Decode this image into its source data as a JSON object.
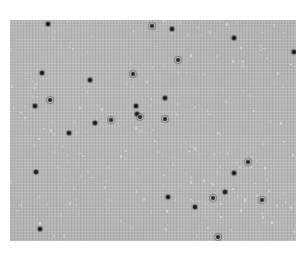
{
  "image": {
    "description": "Grayscale light micrograph with scattered dark particles on a speckled gray field",
    "field": {
      "x": 10,
      "y": 20,
      "width": 286,
      "height": 221,
      "background_color": "#b3b3b3",
      "page_background": "#ffffff"
    },
    "particle_color": "#1a1a1a",
    "particles": [
      {
        "x": 48,
        "y": 24,
        "ring": false
      },
      {
        "x": 152,
        "y": 26,
        "ring": true
      },
      {
        "x": 172,
        "y": 29,
        "ring": false
      },
      {
        "x": 234,
        "y": 38,
        "ring": false
      },
      {
        "x": 294,
        "y": 52,
        "ring": false
      },
      {
        "x": 178,
        "y": 60,
        "ring": true
      },
      {
        "x": 42,
        "y": 73,
        "ring": false
      },
      {
        "x": 133,
        "y": 74,
        "ring": true
      },
      {
        "x": 90,
        "y": 80,
        "ring": false
      },
      {
        "x": 165,
        "y": 98,
        "ring": false
      },
      {
        "x": 50,
        "y": 100,
        "ring": true
      },
      {
        "x": 35,
        "y": 106,
        "ring": false
      },
      {
        "x": 136,
        "y": 106,
        "ring": false
      },
      {
        "x": 137,
        "y": 114,
        "ring": false
      },
      {
        "x": 140,
        "y": 117,
        "ring": true
      },
      {
        "x": 111,
        "y": 120,
        "ring": true
      },
      {
        "x": 165,
        "y": 119,
        "ring": true
      },
      {
        "x": 95,
        "y": 123,
        "ring": false
      },
      {
        "x": 69,
        "y": 133,
        "ring": false
      },
      {
        "x": 248,
        "y": 162,
        "ring": true
      },
      {
        "x": 36,
        "y": 172,
        "ring": false
      },
      {
        "x": 234,
        "y": 173,
        "ring": false
      },
      {
        "x": 225,
        "y": 192,
        "ring": false
      },
      {
        "x": 168,
        "y": 197,
        "ring": false
      },
      {
        "x": 213,
        "y": 198,
        "ring": true
      },
      {
        "x": 262,
        "y": 200,
        "ring": true
      },
      {
        "x": 195,
        "y": 207,
        "ring": false
      },
      {
        "x": 40,
        "y": 229,
        "ring": false
      },
      {
        "x": 218,
        "y": 237,
        "ring": true
      }
    ]
  }
}
